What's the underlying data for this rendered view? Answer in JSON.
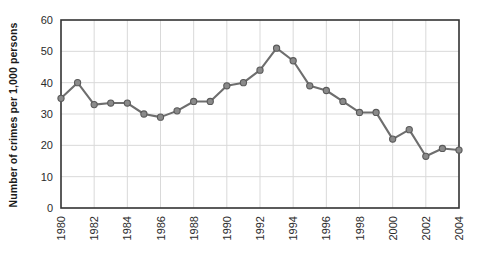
{
  "chart_data": {
    "type": "line",
    "title": "",
    "subtitle": "",
    "xlabel": "",
    "ylabel": "Number of crimes per 1,000 persons",
    "xlim": [
      1980,
      2004
    ],
    "ylim": [
      0,
      60
    ],
    "yticks": [
      0,
      10,
      20,
      30,
      40,
      50,
      60
    ],
    "ytick_labels": [
      "0",
      "10",
      "20",
      "30",
      "40",
      "50",
      "60"
    ],
    "xticks": [
      1980,
      1982,
      1984,
      1986,
      1988,
      1990,
      1992,
      1994,
      1996,
      1998,
      2000,
      2002,
      2004
    ],
    "xtick_labels": [
      "1980",
      "1982",
      "1984",
      "1986",
      "1988",
      "1990",
      "1992",
      "1994",
      "1996",
      "1998",
      "2000",
      "2002",
      "2004"
    ],
    "xtick_rotation": 90,
    "grid": true,
    "grid_axis": "both",
    "legend": false,
    "legend_position": "none",
    "series": [
      {
        "name": "Crime rate",
        "x": [
          1980,
          1981,
          1982,
          1983,
          1984,
          1985,
          1986,
          1987,
          1988,
          1989,
          1990,
          1991,
          1992,
          1993,
          1994,
          1995,
          1996,
          1997,
          1998,
          1999,
          2000,
          2001,
          2002,
          2003,
          2004
        ],
        "values": [
          35,
          40,
          33,
          33.5,
          33.5,
          30,
          29,
          31,
          34,
          34,
          39,
          40,
          44,
          51,
          47,
          39,
          37.5,
          34,
          30.5,
          30.5,
          22,
          25,
          16.5,
          19,
          18.5
        ],
        "line_color": "#6e6e6e",
        "marker_color": "#8a8a8a",
        "marker_edge_color": "#5a5a5a",
        "marker": "circle"
      }
    ],
    "colors": {
      "plot_background": "#ffffff",
      "grid_color": "#d9d9d9",
      "axis_color": "#333333",
      "text_color": "#1a1a1a"
    }
  }
}
